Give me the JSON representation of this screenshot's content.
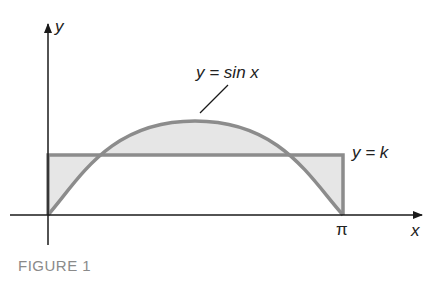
{
  "figure": {
    "caption": "FIGURE 1",
    "axis_labels": {
      "x": "x",
      "y": "y"
    },
    "tick_labels": {
      "pi": "π"
    },
    "curve_labels": {
      "sine": "y = sin x",
      "constant": "y = k"
    },
    "colors": {
      "axis": "#1a1a1a",
      "curve": "#8c8c8c",
      "fill": "#e6e6e6",
      "caption": "#8a8a8a"
    }
  }
}
